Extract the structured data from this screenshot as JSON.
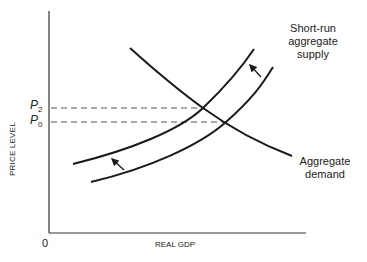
{
  "diagram": {
    "axes": {
      "y_label": "PRICE LEVEL",
      "x_label": "REAL GDP",
      "origin_label": "0"
    },
    "price_levels": [
      {
        "symbol": "P",
        "subscript": "2"
      },
      {
        "symbol": "P",
        "subscript": "0"
      }
    ],
    "curves": {
      "sras": {
        "label_line1": "Short-run",
        "label_line2": "aggregate",
        "label_line3": "supply"
      },
      "ad": {
        "label_line1": "Aggregate",
        "label_line2": "demand"
      }
    },
    "shift_direction": "leftward (supply decreases)",
    "colors": {
      "line": "#1a1a1a",
      "dashed": "#555555",
      "background": "#ffffff"
    }
  }
}
